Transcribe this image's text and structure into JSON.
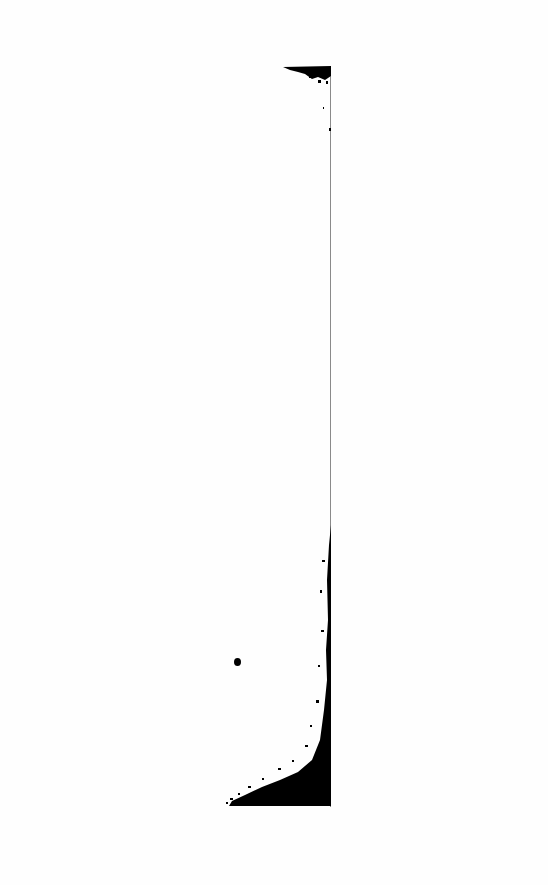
{
  "image": {
    "description": "Thresholded black-and-white scan: thin vertical line with a dense black speckled mass filling the lower-left corner against the line, a small speckled cluster at the top of the line, and a single isolated black dot.",
    "colors": {
      "background": "#fefefe",
      "ink": "#000000",
      "line": "#8a8a8a"
    },
    "vertical_line": {
      "x": 330,
      "y_top": 66,
      "y_bottom": 807
    },
    "top_cluster": {
      "x_from": 283,
      "x_to": 331,
      "y_from": 66,
      "y_to": 82
    },
    "bottom_mass": {
      "x_from": 228,
      "x_to": 331,
      "y_from": 520,
      "y_to": 807
    },
    "dot": {
      "cx": 237,
      "cy": 662
    }
  }
}
